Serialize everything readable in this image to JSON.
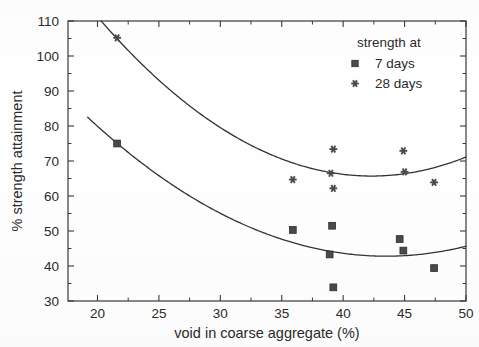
{
  "chart_data": {
    "type": "scatter",
    "title": "",
    "xlabel": "void in coarse aggregate (%)",
    "ylabel": "% strength attainment",
    "xlim": [
      17.6,
      50
    ],
    "ylim": [
      30,
      110
    ],
    "xticks": [
      20,
      25,
      30,
      35,
      40,
      45,
      50
    ],
    "xtick_labels": [
      "20",
      "25",
      "30",
      "35",
      "40",
      "45",
      "50"
    ],
    "yticks": [
      30,
      40,
      50,
      60,
      70,
      80,
      90,
      100,
      110
    ],
    "ytick_labels": [
      "30",
      "40",
      "50",
      "60",
      "70",
      "80",
      "90",
      "100",
      "110"
    ],
    "xminor_step": 2.5,
    "yminor_step": 5,
    "grid": false,
    "legend_position": "top-right",
    "legend_title": "strength at",
    "marker_color": "#4a4a4a",
    "line_color": "#333333",
    "axis_color": "#3a3a3a",
    "series": [
      {
        "name": "7 days",
        "marker": "square",
        "points": [
          {
            "x": 21.6,
            "y": 75.0
          },
          {
            "x": 35.9,
            "y": 50.3
          },
          {
            "x": 39.1,
            "y": 51.5
          },
          {
            "x": 38.9,
            "y": 43.3
          },
          {
            "x": 39.2,
            "y": 33.9
          },
          {
            "x": 44.6,
            "y": 47.7
          },
          {
            "x": 44.9,
            "y": 44.4
          },
          {
            "x": 47.4,
            "y": 39.4
          }
        ],
        "fit_curve": {
          "type": "quadratic",
          "x_start": 19.2,
          "x_end": 50.0,
          "vertex_x": 43.5,
          "vertex_y": 42.8,
          "y_at_x_start": 82.5
        }
      },
      {
        "name": "28 days",
        "marker": "star",
        "points": [
          {
            "x": 21.6,
            "y": 105.2
          },
          {
            "x": 35.9,
            "y": 64.7
          },
          {
            "x": 39.2,
            "y": 73.4
          },
          {
            "x": 39.0,
            "y": 66.5
          },
          {
            "x": 39.2,
            "y": 62.2
          },
          {
            "x": 44.9,
            "y": 72.9
          },
          {
            "x": 45.0,
            "y": 66.9
          },
          {
            "x": 47.4,
            "y": 63.9
          }
        ],
        "fit_curve": {
          "type": "quadratic",
          "x_start": 20.3,
          "x_end": 50.0,
          "vertex_x": 42.3,
          "vertex_y": 65.7,
          "y_at_x_start": 110.0
        }
      }
    ]
  },
  "legend": {
    "title": "strength at",
    "entries": [
      {
        "label": "7 days",
        "marker": "square"
      },
      {
        "label": "28 days",
        "marker": "star"
      }
    ]
  },
  "axes": {
    "x_title": "void in coarse aggregate (%)",
    "y_title": "% strength attainment"
  }
}
